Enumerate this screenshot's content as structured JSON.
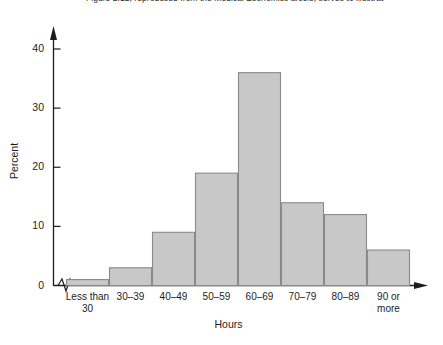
{
  "caption": {
    "text": "Figure 2.12, reproduced from the Medical Economics article, serves to illustrat"
  },
  "chart_data": {
    "type": "bar",
    "title": "",
    "subtitle": "",
    "xlabel": "Hours",
    "ylabel": "Percent",
    "categories": [
      "Less than\n30",
      "30–39",
      "40–49",
      "50–59",
      "60–69",
      "70–79",
      "80–89",
      "90 or\nmore"
    ],
    "values": [
      1,
      3,
      9,
      19,
      36,
      14,
      12,
      6
    ],
    "ylim": [
      0,
      42
    ],
    "yticks": [
      0,
      10,
      20,
      30,
      40
    ],
    "ytick_labels": [
      "0",
      "10",
      "20",
      "30",
      "40"
    ],
    "grid": false,
    "legend": false,
    "legend_position": "none",
    "bar_fill_color": "#c8c8c8",
    "bar_edge_color": "#8a8a8a",
    "axis_color": "#1d1d1d",
    "annotations": [
      "x-axis scale break (zigzag) between origin and first bar",
      "arrowhead at top of y-axis",
      "arrowhead at right end of x-axis"
    ]
  }
}
